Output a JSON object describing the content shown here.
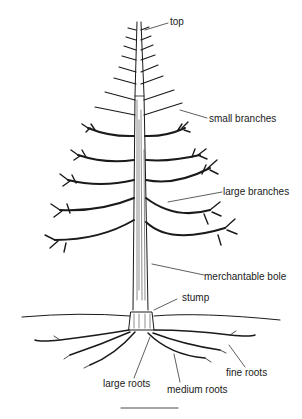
{
  "diagram": {
    "labels": {
      "top": "top",
      "small_branches": "small branches",
      "large_branches": "large branches",
      "merchantable_bole": "merchantable bole",
      "stump": "stump",
      "large_roots": "large roots",
      "medium_roots": "medium roots",
      "fine_roots": "fine roots"
    },
    "colors": {
      "ink": "#1a1a1a",
      "background": "#ffffff"
    }
  }
}
